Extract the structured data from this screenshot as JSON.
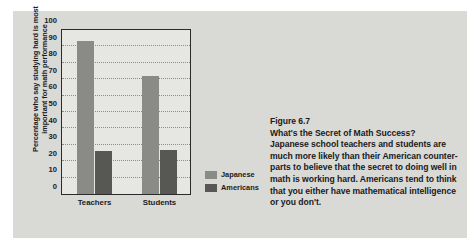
{
  "colors": {
    "page_background": "#ffffff",
    "panel_background": "#d9d9d6",
    "plot_background": "#e6e6e3",
    "axis": "#2b2b2b",
    "text": "#1b1b1b",
    "japanese_bar": "#8a8a86",
    "americans_bar": "#575754"
  },
  "chart_data": {
    "type": "bar",
    "title": "",
    "xlabel": "",
    "ylabel": "Percentage who say studying hard is most important for math performance",
    "ylabel_lines": [
      "Percentage who say studying hard is most",
      "important for math performance"
    ],
    "categories": [
      "Teachers",
      "Students"
    ],
    "series": [
      {
        "name": "Japanese",
        "values": [
          93,
          72
        ],
        "color": "#8a8a86"
      },
      {
        "name": "Americans",
        "values": [
          26,
          27
        ],
        "color": "#575754"
      }
    ],
    "ylim": [
      0,
      100
    ],
    "ytick_step": 10,
    "yticks": [
      0,
      10,
      20,
      30,
      40,
      50,
      60,
      70,
      80,
      90,
      100
    ],
    "grid": true,
    "grid_style": "dotted-horizontal",
    "legend_position": "right-bottom"
  },
  "legend": {
    "entries": [
      {
        "label": "Japanese",
        "color": "#8a8a86"
      },
      {
        "label": "Americans",
        "color": "#575754"
      }
    ]
  },
  "caption": {
    "figure_number": "Figure 6.7",
    "heading": "What's the Secret of Math Success?",
    "body_lines": [
      "Japanese school teachers and students are",
      "much more likely than their American counter-",
      "parts to believe that the secret to doing well in",
      "math is working hard. Americans tend to think",
      "that you either have mathematical intelligence",
      "or you don't."
    ]
  }
}
